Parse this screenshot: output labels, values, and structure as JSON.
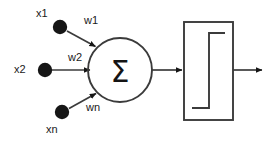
{
  "diagram": {
    "colors": {
      "line": "#3b3b3b",
      "node_fill": "#161616",
      "text": "#1a1a1a",
      "background": "#ffffff"
    },
    "inputs": [
      {
        "id": "x1",
        "label": "x1",
        "weight_label": "w1"
      },
      {
        "id": "x2",
        "label": "x2",
        "weight_label": "w2"
      },
      {
        "id": "xn",
        "label": "xn",
        "weight_label": "wn"
      }
    ],
    "summation": {
      "symbol": "Σ",
      "shape": "circle"
    },
    "activation": {
      "shape": "rectangle",
      "function_glyph": "step"
    },
    "output": {
      "label": ""
    }
  }
}
